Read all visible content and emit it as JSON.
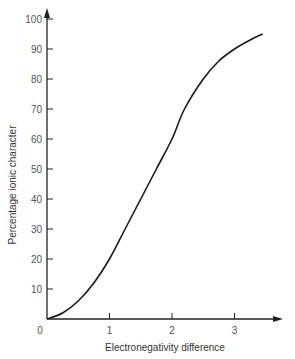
{
  "chart_data": {
    "type": "line",
    "title": "",
    "xlabel": "Electronegativity difference",
    "ylabel": "Percentage ionic character",
    "xlim": [
      0,
      3.6
    ],
    "ylim": [
      0,
      100
    ],
    "x_ticks": [
      "0",
      "1",
      "2",
      "3"
    ],
    "y_ticks": [
      "10",
      "20",
      "30",
      "40",
      "50",
      "60",
      "70",
      "80",
      "90",
      "100"
    ],
    "grid": false,
    "legend": null,
    "series": [
      {
        "name": "Percentage ionic character",
        "x": [
          0,
          0.25,
          0.5,
          0.75,
          1.0,
          1.25,
          1.5,
          1.75,
          2.0,
          2.2,
          2.5,
          2.75,
          3.0,
          3.25,
          3.45
        ],
        "values": [
          0,
          2,
          6,
          12,
          20,
          30,
          40,
          50,
          60,
          70,
          80,
          86,
          90,
          93,
          95
        ]
      }
    ]
  }
}
